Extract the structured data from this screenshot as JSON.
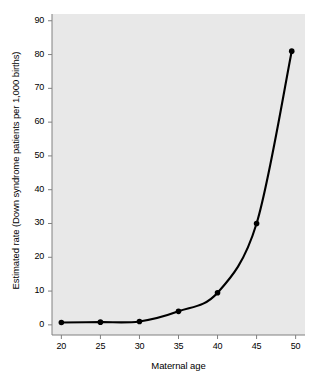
{
  "chart_data": {
    "type": "line",
    "title": "",
    "subtitle": "",
    "xlabel": "Maternal age",
    "ylabel": "Estimated rate (Down syndrome patients per 1,000 births)",
    "x": [
      20,
      25,
      30,
      35,
      40,
      45,
      49.5
    ],
    "values": [
      0.7,
      0.8,
      1.0,
      4.0,
      9.5,
      30.0,
      81.0
    ],
    "series": [
      {
        "name": "Estimated rate",
        "x": [
          20,
          25,
          30,
          35,
          40,
          45,
          49.5
        ],
        "values": [
          0.7,
          0.8,
          1.0,
          4.0,
          9.5,
          30.0,
          81.0
        ]
      }
    ],
    "xlim": [
      18.8,
      51.2
    ],
    "ylim": [
      -3,
      92
    ],
    "xticks": [
      20,
      25,
      30,
      35,
      40,
      45,
      50
    ],
    "yticks": [
      0,
      10,
      20,
      30,
      40,
      50,
      60,
      70,
      80,
      90
    ],
    "xtick_labels": [
      "20",
      "25",
      "30",
      "35",
      "40",
      "45",
      "50"
    ],
    "ytick_labels": [
      "0",
      "10",
      "20",
      "30",
      "40",
      "50",
      "60",
      "70",
      "80",
      "90"
    ],
    "grid": false,
    "legend": null,
    "legend_position": "none",
    "annotations": [],
    "marker": "circle",
    "line_color": "#000000",
    "marker_color": "#000000",
    "panel_color": "#e8e8e8",
    "figure_color": "#ffffff",
    "axis_color": "#808080"
  }
}
